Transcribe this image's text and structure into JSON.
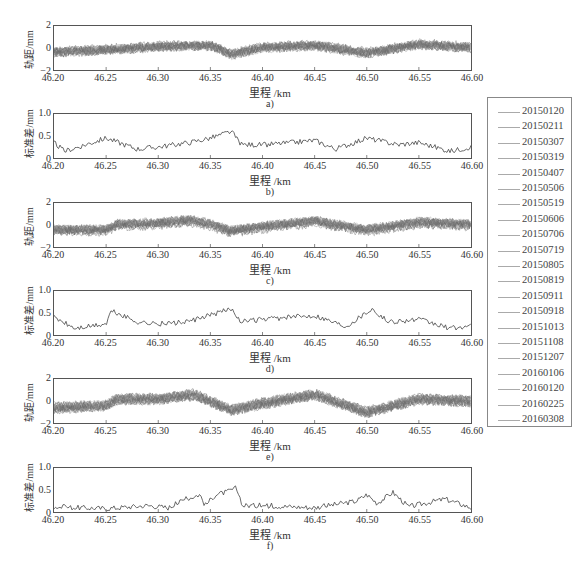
{
  "figure": {
    "x_ticks": [
      "46.20",
      "46.25",
      "46.30",
      "46.35",
      "46.40",
      "46.45",
      "46.50",
      "46.55",
      "46.60"
    ],
    "xlabel": "里程 /km"
  },
  "panels": [
    {
      "id": "a",
      "caption": "a)",
      "ylabel": "轨距/mm",
      "yticks": [
        "2",
        "0",
        "−2"
      ],
      "type": "gauge-multi"
    },
    {
      "id": "b",
      "caption": "b)",
      "ylabel": "标准差/mm",
      "yticks": [
        "1.0",
        "0.5",
        "0"
      ],
      "type": "std"
    },
    {
      "id": "c",
      "caption": "c)",
      "ylabel": "轨距/mm",
      "yticks": [
        "2",
        "0",
        "−2"
      ],
      "type": "gauge-multi"
    },
    {
      "id": "d",
      "caption": "d)",
      "ylabel": "标准差/mm",
      "yticks": [
        "1.0",
        "0.5",
        "0"
      ],
      "type": "std"
    },
    {
      "id": "e",
      "caption": "e)",
      "ylabel": "轨距/mm",
      "yticks": [
        "2",
        "0",
        "−2"
      ],
      "type": "gauge-multi"
    },
    {
      "id": "f",
      "caption": "f)",
      "ylabel": "标准差/mm",
      "yticks": [
        "1.0",
        "0.5",
        "0"
      ],
      "type": "std"
    }
  ],
  "legend": {
    "items": [
      "20150120",
      "20150211",
      "20150307",
      "20150319",
      "20150407",
      "20150506",
      "20150519",
      "20150606",
      "20150706",
      "20150719",
      "20150805",
      "20150819",
      "20150911",
      "20150918",
      "20151013",
      "20151108",
      "20151207",
      "20160106",
      "20160120",
      "20160225",
      "20160308"
    ]
  },
  "colors": {
    "trace": "#6b6b6b",
    "std_line": "#444444",
    "axis": "#555555",
    "legend_line": "#aaaaaa"
  },
  "chart_data": [
    {
      "type": "line",
      "title": "a)",
      "xlabel": "里程 /km",
      "ylabel": "轨距/mm",
      "xlim": [
        46.2,
        46.6
      ],
      "ylim": [
        -2,
        2
      ],
      "grid": false,
      "legend_position": "right (shared)",
      "x": [
        46.2,
        46.25,
        46.3,
        46.35,
        46.37,
        46.4,
        46.45,
        46.5,
        46.55,
        46.6
      ],
      "series_note": "21 overlapping inspection runs; approximate band center",
      "series": [
        {
          "name": "band center",
          "values": [
            -0.4,
            -0.2,
            0.1,
            0.2,
            -0.6,
            0.0,
            0.2,
            -0.5,
            0.3,
            0.0
          ]
        }
      ]
    },
    {
      "type": "line",
      "title": "b)",
      "xlabel": "里程 /km",
      "ylabel": "标准差/mm",
      "xlim": [
        46.2,
        46.6
      ],
      "ylim": [
        0,
        1.0
      ],
      "grid": false,
      "x": [
        46.2,
        46.21,
        46.25,
        46.28,
        46.3,
        46.33,
        46.35,
        46.37,
        46.38,
        46.4,
        46.43,
        46.45,
        46.47,
        46.5,
        46.53,
        46.55,
        46.58,
        46.6
      ],
      "series": [
        {
          "name": "std",
          "values": [
            0.35,
            0.15,
            0.45,
            0.2,
            0.25,
            0.35,
            0.45,
            0.6,
            0.3,
            0.3,
            0.35,
            0.4,
            0.2,
            0.45,
            0.3,
            0.35,
            0.15,
            0.25
          ]
        }
      ]
    },
    {
      "type": "line",
      "title": "c)",
      "xlabel": "里程 /km",
      "ylabel": "轨距/mm",
      "xlim": [
        46.2,
        46.6
      ],
      "ylim": [
        -2,
        2
      ],
      "grid": false,
      "x": [
        46.2,
        46.25,
        46.26,
        46.3,
        46.33,
        46.35,
        46.37,
        46.4,
        46.45,
        46.5,
        46.55,
        46.6
      ],
      "series": [
        {
          "name": "band center",
          "values": [
            -0.5,
            -0.5,
            0.0,
            0.1,
            0.4,
            0.0,
            -0.6,
            -0.2,
            0.3,
            -0.5,
            0.2,
            0.0
          ]
        }
      ]
    },
    {
      "type": "line",
      "title": "d)",
      "xlabel": "里程 /km",
      "ylabel": "标准差/mm",
      "xlim": [
        46.2,
        46.6
      ],
      "ylim": [
        0,
        1.0
      ],
      "grid": false,
      "x": [
        46.2,
        46.22,
        46.25,
        46.255,
        46.28,
        46.3,
        46.33,
        46.35,
        46.37,
        46.38,
        46.4,
        46.45,
        46.48,
        46.505,
        46.52,
        46.55,
        46.58,
        46.6
      ],
      "series": [
        {
          "name": "std",
          "values": [
            0.4,
            0.15,
            0.25,
            0.55,
            0.3,
            0.25,
            0.3,
            0.45,
            0.6,
            0.3,
            0.35,
            0.45,
            0.2,
            0.6,
            0.3,
            0.35,
            0.15,
            0.2
          ]
        }
      ]
    },
    {
      "type": "line",
      "title": "e)",
      "xlabel": "里程 /km",
      "ylabel": "轨距/mm",
      "xlim": [
        46.2,
        46.6
      ],
      "ylim": [
        -2,
        2
      ],
      "grid": false,
      "x": [
        46.2,
        46.25,
        46.26,
        46.3,
        46.335,
        46.35,
        46.37,
        46.4,
        46.45,
        46.5,
        46.55,
        46.6
      ],
      "series": [
        {
          "name": "band center",
          "values": [
            -0.6,
            -0.4,
            0.2,
            0.2,
            0.6,
            0.0,
            -0.8,
            -0.2,
            0.6,
            -1.0,
            0.2,
            0.0
          ]
        }
      ]
    },
    {
      "type": "line",
      "title": "f)",
      "xlabel": "里程 /km",
      "ylabel": "标准差/mm",
      "xlim": [
        46.2,
        46.6
      ],
      "ylim": [
        0,
        1.0
      ],
      "grid": false,
      "x": [
        46.2,
        46.25,
        46.29,
        46.31,
        46.325,
        46.34,
        46.345,
        46.355,
        46.365,
        46.375,
        46.38,
        46.4,
        46.45,
        46.49,
        46.5,
        46.51,
        46.525,
        46.54,
        46.575,
        46.6
      ],
      "series": [
        {
          "name": "std",
          "values": [
            0.12,
            0.08,
            0.15,
            0.1,
            0.28,
            0.4,
            0.15,
            0.4,
            0.45,
            0.55,
            0.15,
            0.15,
            0.1,
            0.25,
            0.4,
            0.2,
            0.45,
            0.12,
            0.3,
            0.1
          ]
        }
      ]
    }
  ]
}
